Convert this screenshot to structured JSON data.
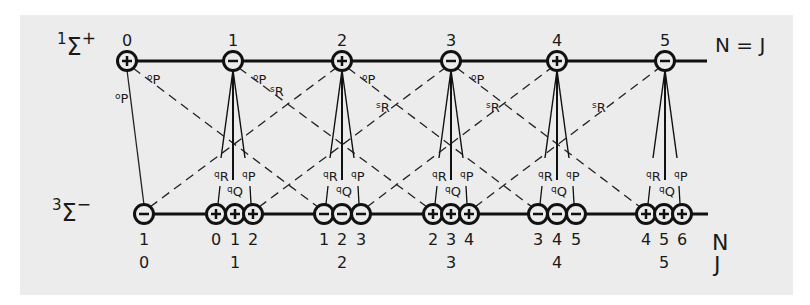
{
  "diagram": {
    "upper_state": {
      "label_main": "Σ",
      "multiplicity": "1",
      "symmetry": "+",
      "line_label": "N = J"
    },
    "lower_state": {
      "label_main": "Σ",
      "multiplicity": "3",
      "symmetry": "−",
      "axis_label_n": "N",
      "axis_label_j": "J"
    },
    "upper_levels": [
      {
        "n": "0",
        "parity": "+",
        "x": 127
      },
      {
        "n": "1",
        "parity": "−",
        "x": 233
      },
      {
        "n": "2",
        "parity": "+",
        "x": 342
      },
      {
        "n": "3",
        "parity": "−",
        "x": 451
      },
      {
        "n": "4",
        "parity": "+",
        "x": 557
      },
      {
        "n": "5",
        "parity": "−",
        "x": 665
      }
    ],
    "lower_groups": [
      {
        "j": "0",
        "parity": "−",
        "levels": [
          {
            "n": "1",
            "x": 144
          }
        ]
      },
      {
        "j": "1",
        "parity": "+",
        "levels": [
          {
            "n": "0",
            "x": 216
          },
          {
            "n": "1",
            "x": 235
          },
          {
            "n": "2",
            "x": 253
          }
        ]
      },
      {
        "j": "2",
        "parity": "−",
        "levels": [
          {
            "n": "1",
            "x": 324
          },
          {
            "n": "2",
            "x": 342
          },
          {
            "n": "3",
            "x": 361
          }
        ]
      },
      {
        "j": "3",
        "parity": "+",
        "levels": [
          {
            "n": "2",
            "x": 433
          },
          {
            "n": "3",
            "x": 451
          },
          {
            "n": "4",
            "x": 469
          }
        ]
      },
      {
        "j": "4",
        "parity": "−",
        "levels": [
          {
            "n": "3",
            "x": 538
          },
          {
            "n": "4",
            "x": 557
          },
          {
            "n": "5",
            "x": 576
          }
        ]
      },
      {
        "j": "5",
        "parity": "+",
        "levels": [
          {
            "n": "4",
            "x": 646
          },
          {
            "n": "5",
            "x": 664
          },
          {
            "n": "6",
            "x": 682
          }
        ]
      }
    ],
    "branch_labels": {
      "oP": "P",
      "oP_sup": "o",
      "sR": "R",
      "sR_sup": "s",
      "qR": "R",
      "qQ": "Q",
      "qP": "P",
      "q_sup": "q"
    }
  }
}
